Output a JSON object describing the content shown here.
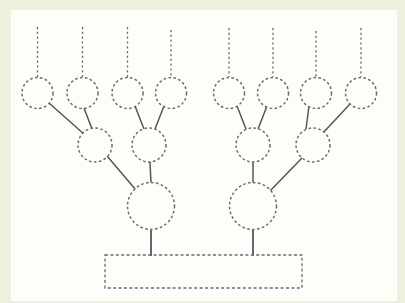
{
  "figure": {
    "type": "diagram",
    "background_color": "#eef0dd",
    "paper_color": "#fdfdfa",
    "node_stroke_color": "#6b6b72",
    "edge_stroke_color": "#55555c",
    "node_fill": "none",
    "node_style": "dashed-outline-circle",
    "edge_style": "solid",
    "stub_style": "dashed-vertical-line"
  },
  "canvas": {
    "width": 405,
    "height": 303,
    "paper": {
      "x": 11,
      "y": 10,
      "width": 386,
      "height": 291
    }
  },
  "nodes": {
    "leaf_level": [
      {
        "id": "L1",
        "label": "",
        "cx": 37.5,
        "cy": 93,
        "r": 15.5
      },
      {
        "id": "L2",
        "label": "",
        "cx": 82.5,
        "cy": 93,
        "r": 15.5
      },
      {
        "id": "L3",
        "label": "",
        "cx": 127.5,
        "cy": 93,
        "r": 15.5
      },
      {
        "id": "L4",
        "label": "",
        "cx": 171,
        "cy": 93,
        "r": 15.5
      },
      {
        "id": "L5",
        "label": "",
        "cx": 229,
        "cy": 93,
        "r": 15.5
      },
      {
        "id": "L6",
        "label": "",
        "cx": 273,
        "cy": 93,
        "r": 15.5
      },
      {
        "id": "L7",
        "label": "",
        "cx": 316,
        "cy": 93,
        "r": 15.5
      },
      {
        "id": "L8",
        "label": "",
        "cx": 361,
        "cy": 93,
        "r": 15.5
      }
    ],
    "mid_level": [
      {
        "id": "M1",
        "label": "",
        "cx": 95,
        "cy": 145,
        "r": 17
      },
      {
        "id": "M2",
        "label": "",
        "cx": 149,
        "cy": 145,
        "r": 17
      },
      {
        "id": "M3",
        "label": "",
        "cx": 253,
        "cy": 145,
        "r": 17
      },
      {
        "id": "M4",
        "label": "",
        "cx": 313,
        "cy": 145,
        "r": 17
      }
    ],
    "root_level": [
      {
        "id": "R1",
        "label": "",
        "cx": 151,
        "cy": 206,
        "r": 23.5
      },
      {
        "id": "R2",
        "label": "",
        "cx": 253,
        "cy": 206,
        "r": 23.5
      }
    ]
  },
  "stubs": [
    {
      "id": "S1",
      "x": 37.5,
      "y_top": 27,
      "y_bottom": 77
    },
    {
      "id": "S2",
      "x": 82.5,
      "y_top": 27,
      "y_bottom": 77
    },
    {
      "id": "S3",
      "x": 127.5,
      "y_top": 27,
      "y_bottom": 77
    },
    {
      "id": "S4",
      "x": 171,
      "y_top": 30,
      "y_bottom": 77
    },
    {
      "id": "S5",
      "x": 229,
      "y_top": 28,
      "y_bottom": 77
    },
    {
      "id": "S6",
      "x": 273,
      "y_top": 28,
      "y_bottom": 77
    },
    {
      "id": "S7",
      "x": 316,
      "y_top": 31,
      "y_bottom": 77
    },
    {
      "id": "S8",
      "x": 361,
      "y_top": 28,
      "y_bottom": 77
    }
  ],
  "edges": [
    {
      "id": "E1",
      "from": "L1",
      "to": "M1",
      "x1": 49,
      "y1": 103,
      "x2": 85,
      "y2": 135
    },
    {
      "id": "E2",
      "from": "L2",
      "to": "M1",
      "x1": 84,
      "y1": 108,
      "x2": 92,
      "y2": 129
    },
    {
      "id": "E3",
      "from": "L3",
      "to": "M2",
      "x1": 135,
      "y1": 106,
      "x2": 144,
      "y2": 129
    },
    {
      "id": "E4",
      "from": "L4",
      "to": "M2",
      "x1": 164,
      "y1": 106,
      "x2": 155,
      "y2": 129
    },
    {
      "id": "E5",
      "from": "M1",
      "to": "R1",
      "x1": 107,
      "y1": 156,
      "x2": 136,
      "y2": 190
    },
    {
      "id": "E6",
      "from": "M2",
      "to": "R1",
      "x1": 150,
      "y1": 162,
      "x2": 151,
      "y2": 183
    },
    {
      "id": "E7",
      "from": "L5",
      "to": "M3",
      "x1": 237,
      "y1": 106,
      "x2": 246,
      "y2": 129
    },
    {
      "id": "E8",
      "from": "L6",
      "to": "M3",
      "x1": 267,
      "y1": 106,
      "x2": 258,
      "y2": 129
    },
    {
      "id": "E9",
      "from": "L7",
      "to": "M4",
      "x1": 309,
      "y1": 106,
      "x2": 306,
      "y2": 129
    },
    {
      "id": "E10",
      "from": "L8",
      "to": "M4",
      "x1": 350,
      "y1": 104,
      "x2": 322,
      "y2": 134
    },
    {
      "id": "E11",
      "from": "M3",
      "to": "R2",
      "x1": 253,
      "y1": 162,
      "x2": 253,
      "y2": 183
    },
    {
      "id": "E12",
      "from": "M4",
      "to": "R2",
      "x1": 302,
      "y1": 158,
      "x2": 270,
      "y2": 191
    }
  ],
  "root_stems": [
    {
      "id": "T1",
      "from": "R1",
      "x": 151,
      "y_top": 230,
      "y_bottom": 256
    },
    {
      "id": "T2",
      "from": "R2",
      "x": 253,
      "y_top": 230,
      "y_bottom": 256
    }
  ],
  "container": {
    "id": "BOX",
    "label": "",
    "x": 105,
    "y": 255,
    "width": 197,
    "height": 33,
    "style": "dashed-rectangle"
  }
}
